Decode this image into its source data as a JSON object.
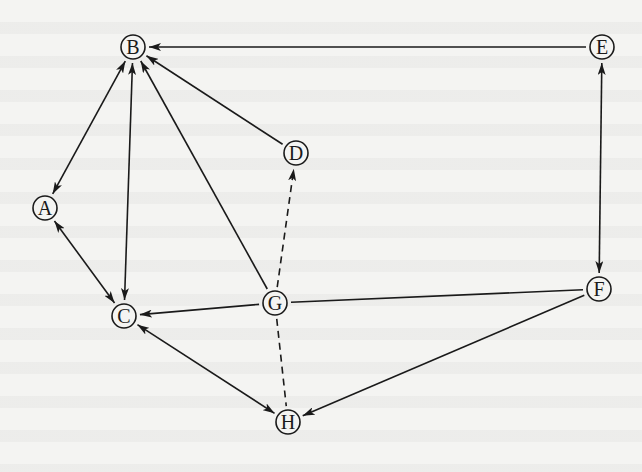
{
  "diagram": {
    "type": "directed-graph",
    "colors": {
      "background": "#f4f4f2",
      "stroke": "#1a1a1a"
    },
    "nodes": [
      {
        "id": "A",
        "label": "A",
        "x": 45,
        "y": 208
      },
      {
        "id": "B",
        "label": "B",
        "x": 133,
        "y": 47
      },
      {
        "id": "C",
        "label": "C",
        "x": 124,
        "y": 316
      },
      {
        "id": "D",
        "label": "D",
        "x": 296,
        "y": 153
      },
      {
        "id": "E",
        "label": "E",
        "x": 602,
        "y": 47
      },
      {
        "id": "F",
        "label": "F",
        "x": 599,
        "y": 289
      },
      {
        "id": "G",
        "label": "G",
        "x": 275,
        "y": 303
      },
      {
        "id": "H",
        "label": "H",
        "x": 288,
        "y": 422
      }
    ],
    "edges": [
      {
        "from": "E",
        "to": "B",
        "style": "solid",
        "direction": "forward"
      },
      {
        "from": "E",
        "to": "F",
        "style": "solid",
        "direction": "both"
      },
      {
        "from": "A",
        "to": "B",
        "style": "solid",
        "direction": "both"
      },
      {
        "from": "C",
        "to": "B",
        "style": "solid",
        "direction": "both"
      },
      {
        "from": "G",
        "to": "B",
        "style": "solid",
        "direction": "forward"
      },
      {
        "from": "D",
        "to": "B",
        "style": "solid",
        "direction": "forward"
      },
      {
        "from": "G",
        "to": "D",
        "style": "dashed",
        "direction": "forward"
      },
      {
        "from": "G",
        "to": "C",
        "style": "solid",
        "direction": "forward"
      },
      {
        "from": "G",
        "to": "F",
        "style": "solid",
        "direction": "none"
      },
      {
        "from": "F",
        "to": "H",
        "style": "solid",
        "direction": "forward"
      },
      {
        "from": "A",
        "to": "C",
        "style": "solid",
        "direction": "both"
      },
      {
        "from": "C",
        "to": "H",
        "style": "solid",
        "direction": "both"
      },
      {
        "from": "G",
        "to": "H",
        "style": "dashed",
        "direction": "none"
      }
    ]
  }
}
